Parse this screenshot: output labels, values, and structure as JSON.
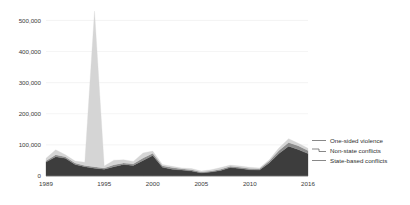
{
  "chart_data": {
    "type": "area",
    "stacked": true,
    "title": "",
    "subtitle": "",
    "xlabel": "",
    "ylabel": "",
    "xlim": [
      1989,
      2016
    ],
    "ylim": [
      0,
      540000
    ],
    "grid": true,
    "legend_position": "right",
    "x": [
      1989,
      1990,
      1991,
      1992,
      1993,
      1994,
      1995,
      1996,
      1997,
      1998,
      1999,
      2000,
      2001,
      2002,
      2003,
      2004,
      2005,
      2006,
      2007,
      2008,
      2009,
      2010,
      2011,
      2012,
      2013,
      2014,
      2015,
      2016
    ],
    "xticks": [
      1989,
      1995,
      2000,
      2005,
      2010,
      2016
    ],
    "xticklabels": [
      "1989",
      "1995",
      "2000",
      "2005",
      "2010",
      "2016"
    ],
    "yticks": [
      0,
      100000,
      200000,
      300000,
      400000,
      500000
    ],
    "yticklabels": [
      "0",
      "100,000",
      "200,000",
      "300,000",
      "400,000",
      "500,000"
    ],
    "series": [
      {
        "name": "State-based conflicts",
        "color": "#3d3d3d",
        "values": [
          45000,
          62000,
          57000,
          37000,
          30000,
          25000,
          22000,
          30000,
          37000,
          34000,
          50000,
          66000,
          28000,
          22000,
          19000,
          16000,
          10000,
          13000,
          18000,
          27000,
          24000,
          20000,
          19000,
          42000,
          72000,
          96000,
          85000,
          72000
        ]
      },
      {
        "name": "Non-state conflicts",
        "color": "#8c8c8c",
        "values": [
          4000,
          6000,
          5000,
          5000,
          4000,
          5000,
          4000,
          6000,
          5000,
          5000,
          8000,
          7000,
          5000,
          5000,
          4000,
          4000,
          3000,
          3000,
          4000,
          4000,
          4000,
          4000,
          4000,
          6000,
          10000,
          12000,
          12000,
          10000
        ]
      },
      {
        "name": "One-sided violence",
        "color": "#d5d5d5",
        "values": [
          8000,
          16000,
          6000,
          6000,
          10000,
          500000,
          6000,
          15000,
          10000,
          8000,
          16000,
          7000,
          4000,
          4000,
          3000,
          4000,
          3000,
          4000,
          5000,
          4000,
          4000,
          4000,
          3000,
          4000,
          8000,
          12000,
          8000,
          7000
        ]
      }
    ],
    "annotations": [],
    "notes": {
      "peak_year": "1994",
      "peak_value": "530,000"
    }
  },
  "legend": {
    "items": [
      {
        "label": "One-sided violence",
        "color": "#d5d5d5"
      },
      {
        "label": "Non-state conflicts",
        "color": "#8c8c8c"
      },
      {
        "label": "State-based conflicts",
        "color": "#3d3d3d"
      }
    ]
  }
}
